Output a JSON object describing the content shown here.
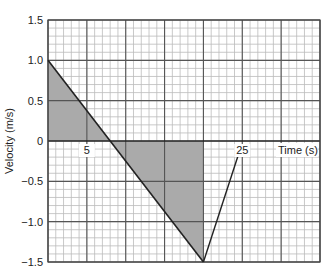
{
  "chart_data": {
    "type": "line",
    "title": "",
    "xlabel": "Time (s)",
    "ylabel": "Velocity (m/s)",
    "xlim": [
      0,
      35
    ],
    "ylim": [
      -1.5,
      1.5
    ],
    "grid": true,
    "grid_major_x": 5,
    "grid_minor_x": 1,
    "grid_major_y": 0.5,
    "grid_minor_y": 0.1,
    "x_tick_labels": [
      {
        "value": 5,
        "label": "5"
      },
      {
        "value": 25,
        "label": "25"
      }
    ],
    "y_tick_labels": [
      {
        "value": 1.5,
        "label": "1.5"
      },
      {
        "value": 1.0,
        "label": "1.0"
      },
      {
        "value": 0.5,
        "label": "0.5"
      },
      {
        "value": 0,
        "label": "0"
      },
      {
        "value": -0.5,
        "label": "−0.5"
      },
      {
        "value": -1.0,
        "label": "−1.0"
      },
      {
        "value": -1.5,
        "label": "−1.5"
      }
    ],
    "series": [
      {
        "name": "velocity",
        "x": [
          0,
          20
        ],
        "y": [
          1.0,
          -1.5
        ]
      }
    ],
    "shaded_regions": [
      {
        "name": "positive-area",
        "points": [
          [
            0,
            1.0
          ],
          [
            0,
            0
          ],
          [
            8,
            0
          ]
        ]
      },
      {
        "name": "negative-area",
        "points": [
          [
            8,
            0
          ],
          [
            20,
            0
          ],
          [
            20,
            -1.5
          ]
        ]
      }
    ],
    "annotations": [
      {
        "type": "leader-line",
        "from": [
          20,
          -1.5
        ],
        "to": [
          24.6,
          -0.14
        ],
        "label": "25"
      }
    ],
    "colors": {
      "fill": "#aaaaaa",
      "line": "#222222",
      "grid_major": "#555555",
      "grid_minor": "#bbbbbb"
    }
  }
}
